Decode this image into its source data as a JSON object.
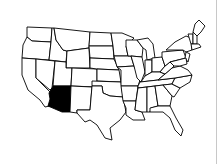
{
  "map": {
    "title": "United States",
    "highlighted_state": "Arizona",
    "highlight_color": "#000000",
    "fill_color": "#ffffff",
    "stroke_color": "#000000"
  }
}
